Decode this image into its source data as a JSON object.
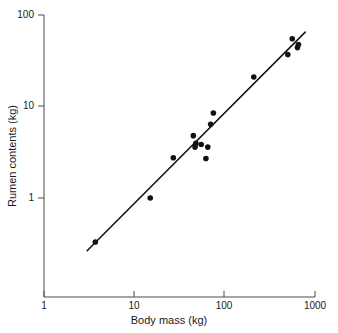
{
  "chart_data": {
    "type": "scatter",
    "title": "",
    "xlabel": "Body mass (kg)",
    "ylabel": "Rumen contents (kg)",
    "xscale": "log",
    "yscale": "log",
    "xlim": [
      1,
      1000
    ],
    "ylim": [
      0.2,
      100
    ],
    "grid": false,
    "legend": null,
    "x_ticks": [
      "1",
      "10",
      "100",
      "1000"
    ],
    "x_tick_values": [
      1,
      10,
      100,
      1000
    ],
    "y_ticks": [
      "1",
      "10",
      "100"
    ],
    "y_tick_values": [
      1,
      10,
      100
    ],
    "points": [
      {
        "x": 3.7,
        "y": 0.33
      },
      {
        "x": 15.0,
        "y": 1.0
      },
      {
        "x": 27.0,
        "y": 2.75
      },
      {
        "x": 45.0,
        "y": 4.8
      },
      {
        "x": 47.0,
        "y": 3.6
      },
      {
        "x": 48.0,
        "y": 3.95
      },
      {
        "x": 55.0,
        "y": 3.85
      },
      {
        "x": 62.0,
        "y": 2.7
      },
      {
        "x": 65.0,
        "y": 3.6
      },
      {
        "x": 70.0,
        "y": 6.4
      },
      {
        "x": 75.0,
        "y": 8.5
      },
      {
        "x": 210.0,
        "y": 21.0
      },
      {
        "x": 500.0,
        "y": 37.0
      },
      {
        "x": 560.0,
        "y": 55.0
      },
      {
        "x": 640.0,
        "y": 44.0
      },
      {
        "x": 655.0,
        "y": 47.5
      }
    ],
    "fit_line": {
      "type": "power-law regression",
      "x_start": 3.0,
      "y_start": 0.265,
      "x_end": 780.0,
      "y_end": 65.0
    },
    "marker": {
      "shape": "filled-circle",
      "color": "#111111",
      "size_px": 5.6
    },
    "line_color": "#111111",
    "axis_color": "#4a4a4a",
    "background_color": "#ffffff"
  }
}
